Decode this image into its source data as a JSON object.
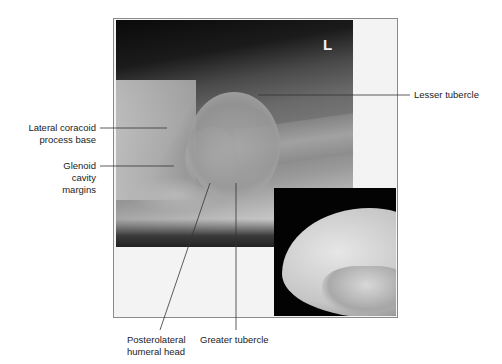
{
  "figure": {
    "side_marker": "L",
    "labels": {
      "lesser_tubercle": "Lesser tubercle",
      "lateral_coracoid_line1": "Lateral coracoid",
      "lateral_coracoid_line2": "process base",
      "glenoid_line1": "Glenoid",
      "glenoid_line2": "cavity",
      "glenoid_line3": "margins",
      "posterolateral_line1": "Posterolateral",
      "posterolateral_line2": "humeral head",
      "greater_tubercle": "Greater tubercle"
    },
    "colors": {
      "leader_line": "#333333",
      "frame_border": "#8a8a8a",
      "text": "#222222"
    }
  }
}
